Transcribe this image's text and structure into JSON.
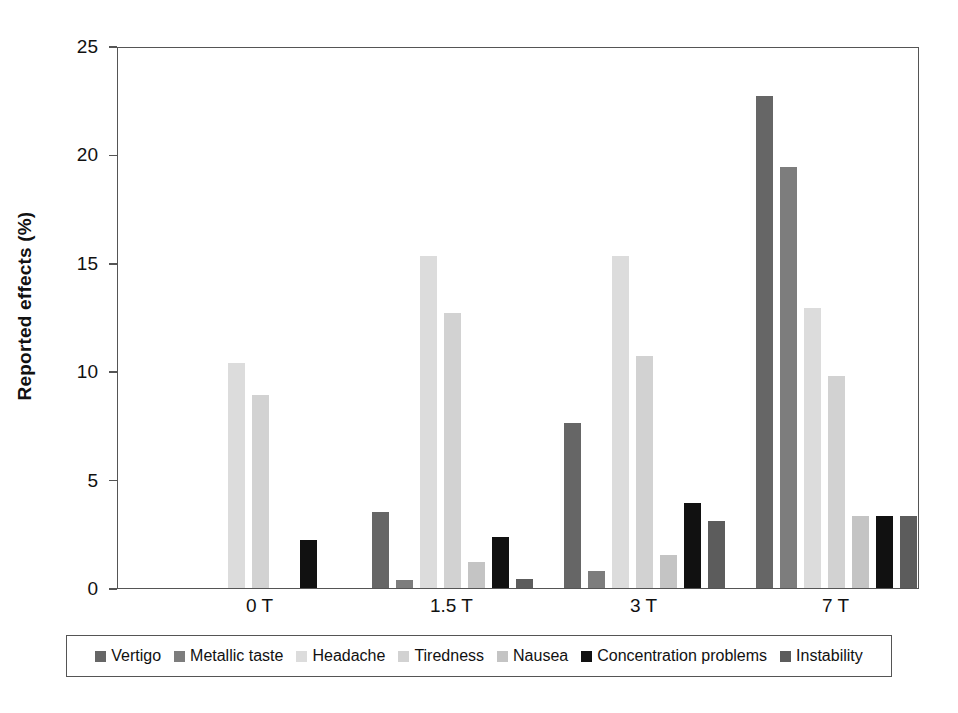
{
  "chart_data": {
    "type": "bar",
    "title": "",
    "xlabel": "",
    "ylabel": "Reported effects (%)",
    "categories": [
      "0 T",
      "1.5 T",
      "3 T",
      "7 T"
    ],
    "ylim": [
      0,
      25
    ],
    "yticks": [
      "0",
      "5",
      "10",
      "15",
      "20",
      "25"
    ],
    "grid": false,
    "legend_position": "bottom",
    "series": [
      {
        "name": "Vertigo",
        "color": "#666666",
        "values": [
          0,
          3.5,
          7.6,
          22.7
        ]
      },
      {
        "name": "Metallic taste",
        "color": "#7d7d7d",
        "values": [
          0,
          0.35,
          0.8,
          19.4
        ]
      },
      {
        "name": "Headache",
        "color": "#dcdcdc",
        "values": [
          10.4,
          15.3,
          15.3,
          12.9
        ]
      },
      {
        "name": "Tiredness",
        "color": "#d2d2d2",
        "values": [
          8.9,
          12.7,
          10.7,
          9.8
        ]
      },
      {
        "name": "Nausea",
        "color": "#c4c4c4",
        "values": [
          0,
          1.2,
          1.5,
          3.3
        ]
      },
      {
        "name": "Concentration problems",
        "color": "#111111",
        "values": [
          2.2,
          2.35,
          3.9,
          3.3
        ]
      },
      {
        "name": "Instability",
        "color": "#5c5c5c",
        "values": [
          0,
          0.4,
          3.1,
          3.3
        ]
      }
    ]
  },
  "axis": {
    "frame_color": "#555555"
  }
}
